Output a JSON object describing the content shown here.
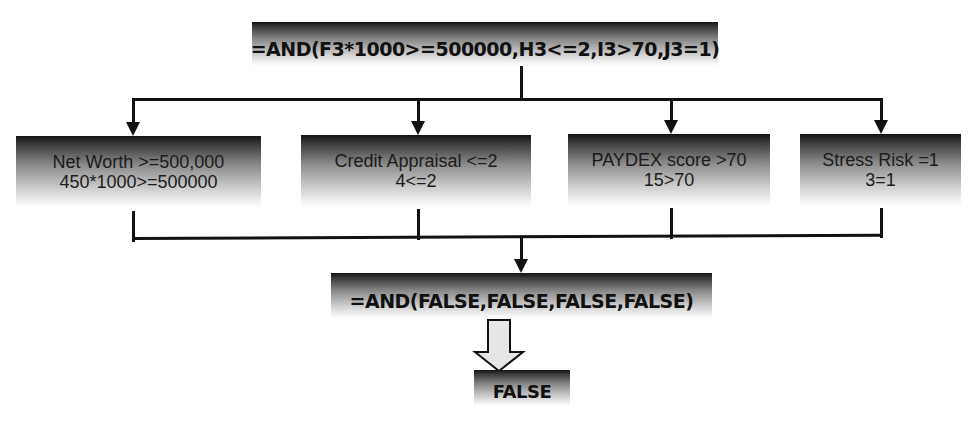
{
  "diagram": {
    "top_formula": "=AND(F3*1000>=500000,H3<=2,I3>70,J3=1)",
    "conditions": [
      {
        "label": "Net Worth >=500,000",
        "evaluation": "450*1000>=500000"
      },
      {
        "label": "Credit Appraisal <=2",
        "evaluation": "4<=2"
      },
      {
        "label": "PAYDEX score >70",
        "evaluation": "15>70"
      },
      {
        "label": "Stress Risk =1",
        "evaluation": "3=1"
      }
    ],
    "evaluated_formula": "=AND(FALSE,FALSE,FALSE,FALSE)",
    "result": "FALSE",
    "colors": {
      "line": "#111111",
      "box_gradient_top": "#141414",
      "box_gradient_bottom": "#ffffff",
      "block_arrow_fill": "#e6e6e6"
    }
  }
}
